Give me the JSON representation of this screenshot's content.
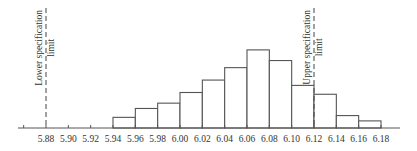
{
  "chart_data": {
    "type": "bar",
    "subtype": "histogram",
    "title": "",
    "xlabel": "",
    "ylabel": "",
    "bin_edges": [
      5.94,
      5.96,
      5.98,
      6.0,
      6.02,
      6.04,
      6.06,
      6.08,
      6.1,
      6.12,
      6.14,
      6.16,
      6.18
    ],
    "categories": [
      "5.94-5.96",
      "5.96-5.98",
      "5.98-6.00",
      "6.00-6.02",
      "6.02-6.04",
      "6.04-6.06",
      "6.06-6.08",
      "6.08-6.10",
      "6.10-6.12",
      "6.12-6.14",
      "6.14-6.16",
      "6.16-6.18"
    ],
    "values": [
      3,
      5.5,
      7,
      10,
      13.5,
      17,
      22,
      19,
      12,
      9.5,
      3.5,
      2
    ],
    "x_ticks": [
      5.86,
      5.88,
      5.9,
      5.92,
      5.94,
      5.96,
      5.98,
      6.0,
      6.02,
      6.04,
      6.06,
      6.08,
      6.1,
      6.12,
      6.14,
      6.16,
      6.18
    ],
    "x_tick_labels": [
      "",
      "5.88",
      "5.90",
      "5.92",
      "5.94",
      "5.96",
      "5.98",
      "6.00",
      "6.02",
      "6.04",
      "6.06",
      "6.08",
      "6.10",
      "6.12",
      "6.14",
      "6.16",
      "6.18"
    ],
    "xlim": [
      5.855,
      6.22
    ],
    "grid": false,
    "legend": null,
    "annotations": [
      {
        "name": "lower-spec-limit",
        "x": 5.88,
        "style": "dashed",
        "lines": [
          "Lower specification",
          "limit"
        ]
      },
      {
        "name": "upper-spec-limit",
        "x": 6.12,
        "style": "dashed",
        "lines": [
          "Upper specification",
          "limit"
        ]
      }
    ]
  },
  "layout": {
    "axis_y": 128,
    "x0_value": 5.88,
    "x0_px": 46,
    "px_per_unit": 1116.7,
    "px_per_count": 3.55,
    "axis_start_px": 18,
    "axis_end_px": 400,
    "spec_top_px": 8
  }
}
